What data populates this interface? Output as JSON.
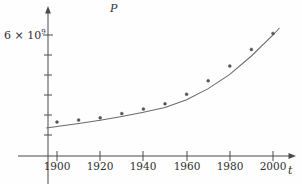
{
  "chart_data": {
    "type": "scatter",
    "title": "",
    "subtitle": "",
    "xlabel": "t",
    "ylabel": "P",
    "xlim": [
      1895,
      2008
    ],
    "ylim": [
      0,
      7000000000
    ],
    "grid": false,
    "legend": null,
    "x_tick_labels": [
      "1900",
      "1920",
      "1940",
      "1960",
      "1980",
      "2000"
    ],
    "x_ticks": [
      1900,
      1920,
      1940,
      1960,
      1980,
      2000
    ],
    "y_tick_labels": [
      "6 × 10",
      "9"
    ],
    "y_labeled_tick_value": 6000000000,
    "y_tick_values": [
      1000000000,
      2000000000,
      3000000000,
      4000000000,
      5000000000,
      6000000000
    ],
    "x": [
      1900,
      1910,
      1920,
      1930,
      1940,
      1950,
      1960,
      1970,
      1980,
      1990,
      2000
    ],
    "values": [
      1650000000,
      1750000000,
      1860000000,
      2070000000,
      2300000000,
      2560000000,
      3040000000,
      3710000000,
      4450000000,
      5280000000,
      6080000000
    ],
    "series": [
      {
        "name": "data points",
        "marker": "dot",
        "x": [
          1900,
          1910,
          1920,
          1930,
          1940,
          1950,
          1960,
          1970,
          1980,
          1990,
          2000
        ],
        "values": [
          1650000000,
          1750000000,
          1860000000,
          2070000000,
          2300000000,
          2560000000,
          3040000000,
          3710000000,
          4450000000,
          5280000000,
          6080000000
        ]
      },
      {
        "name": "fitted exponential model",
        "marker": "line",
        "x": [
          1895,
          1900,
          1910,
          1920,
          1930,
          1940,
          1950,
          1960,
          1970,
          1980,
          1990,
          2000,
          2003
        ],
        "values": [
          1350000000,
          1420000000,
          1570000000,
          1740000000,
          1930000000,
          2140000000,
          2380000000,
          2760000000,
          3320000000,
          4030000000,
          4950000000,
          6000000000,
          6350000000
        ]
      }
    ],
    "annotations": []
  },
  "axes": {
    "p_axis_label": "P",
    "t_axis_label": "t",
    "y_label_prefix": "6 × 10",
    "y_label_exponent": "9"
  },
  "x_tick_labels": [
    "1900",
    "1920",
    "1940",
    "1960",
    "1980",
    "2000"
  ],
  "colors": {
    "axis": "#4a4a4a",
    "curve": "#6b6b6b",
    "point": "#555555",
    "background": "#fefefe",
    "text": "#2e2e2e"
  }
}
